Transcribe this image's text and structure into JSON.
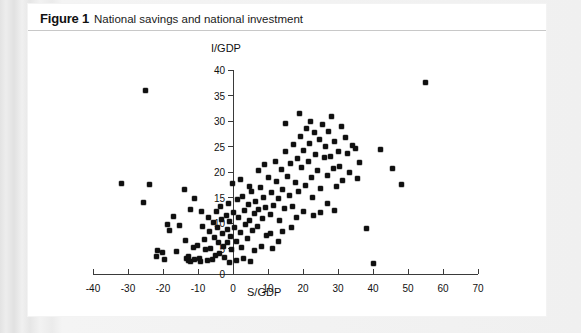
{
  "figure": {
    "label": "Figure 1",
    "title": "National savings and national investment"
  },
  "colors": {
    "page_background": "#e9e9e9",
    "figure_background": "#ffffff",
    "rule": "#c8c8c8",
    "axis": "#3a3a3a",
    "marker": "#101010",
    "text": "#111111"
  },
  "chart_data": {
    "type": "scatter",
    "title": "National savings and national investment",
    "xlabel": "S/GDP",
    "ylabel": "I/GDP",
    "xlim": [
      -45,
      72
    ],
    "ylim": [
      0,
      41
    ],
    "xticks": [
      -40,
      -30,
      -20,
      -10,
      0,
      10,
      20,
      30,
      40,
      50,
      60,
      70
    ],
    "xtick_labels": [
      "-40",
      "-30",
      "-20",
      "-10",
      "0",
      "10",
      "20",
      "30",
      "40",
      "50",
      "60",
      "70"
    ],
    "yticks": [
      0,
      5,
      10,
      15,
      20,
      25,
      30,
      35,
      40
    ],
    "ytick_labels": [
      "0",
      "5",
      "10",
      "15",
      "20",
      "25",
      "30",
      "35",
      "40"
    ],
    "grid": false,
    "legend": null,
    "axis_origin": [
      0,
      0
    ],
    "x_axis_position": "bottom",
    "y_axis_position": "zero",
    "series": [
      {
        "name": "Countries",
        "marker": "diamond",
        "color": "#101010",
        "points": [
          [
            -25.0,
            36.0
          ],
          [
            -32.0,
            17.8
          ],
          [
            -24.0,
            17.6
          ],
          [
            -25.5,
            14.0
          ],
          [
            -14.0,
            16.6
          ],
          [
            -17.0,
            11.3
          ],
          [
            -18.8,
            9.8
          ],
          [
            -18.2,
            8.6
          ],
          [
            -15.3,
            9.5
          ],
          [
            -12.2,
            12.6
          ],
          [
            -21.5,
            4.6
          ],
          [
            -20.2,
            4.3
          ],
          [
            -16.2,
            4.4
          ],
          [
            -13.6,
            6.6
          ],
          [
            -13.2,
            3.0
          ],
          [
            -12.8,
            2.6
          ],
          [
            -12.6,
            3.4
          ],
          [
            -12.2,
            2.4
          ],
          [
            -11.4,
            5.2
          ],
          [
            -10.9,
            2.9
          ],
          [
            -10.2,
            5.6
          ],
          [
            -9.6,
            3.1
          ],
          [
            -9.2,
            2.5
          ],
          [
            -8.7,
            9.4
          ],
          [
            -8.2,
            6.7
          ],
          [
            -7.8,
            4.9
          ],
          [
            -7.4,
            2.7
          ],
          [
            -7.0,
            11.0
          ],
          [
            -6.6,
            8.3
          ],
          [
            -6.4,
            5.0
          ],
          [
            -6.0,
            2.8
          ],
          [
            -5.7,
            10.1
          ],
          [
            -5.4,
            7.1
          ],
          [
            -5.0,
            3.6
          ],
          [
            -4.6,
            12.3
          ],
          [
            -4.4,
            9.1
          ],
          [
            -4.1,
            6.2
          ],
          [
            -3.8,
            4.1
          ],
          [
            -3.5,
            13.2
          ],
          [
            -3.2,
            10.6
          ],
          [
            -2.9,
            7.9
          ],
          [
            -2.6,
            5.4
          ],
          [
            -2.3,
            3.2
          ],
          [
            -2.0,
            11.4
          ],
          [
            -1.7,
            8.8
          ],
          [
            -1.5,
            6.1
          ],
          [
            -1.2,
            13.8
          ],
          [
            -0.9,
            10.2
          ],
          [
            -0.6,
            7.4
          ],
          [
            -0.3,
            4.8
          ],
          [
            0.2,
            12.0
          ],
          [
            0.5,
            9.2
          ],
          [
            0.9,
            6.3
          ],
          [
            1.2,
            14.6
          ],
          [
            1.6,
            11.1
          ],
          [
            2.0,
            8.2
          ],
          [
            2.4,
            5.1
          ],
          [
            2.8,
            15.2
          ],
          [
            3.2,
            12.4
          ],
          [
            3.6,
            9.8
          ],
          [
            4.0,
            7.0
          ],
          [
            4.4,
            13.6
          ],
          [
            4.8,
            10.5
          ],
          [
            5.2,
            16.2
          ],
          [
            5.6,
            8.6
          ],
          [
            6.0,
            11.8
          ],
          [
            6.5,
            14.2
          ],
          [
            7.0,
            9.4
          ],
          [
            7.4,
            12.6
          ],
          [
            7.9,
            17.0
          ],
          [
            8.3,
            10.8
          ],
          [
            8.8,
            15.0
          ],
          [
            9.2,
            13.0
          ],
          [
            9.7,
            7.6
          ],
          [
            10.1,
            19.0
          ],
          [
            10.6,
            11.6
          ],
          [
            11.0,
            16.0
          ],
          [
            11.5,
            13.4
          ],
          [
            12.0,
            22.0
          ],
          [
            12.4,
            18.2
          ],
          [
            12.9,
            14.8
          ],
          [
            13.3,
            10.4
          ],
          [
            13.8,
            20.4
          ],
          [
            14.2,
            16.6
          ],
          [
            14.7,
            12.8
          ],
          [
            15.1,
            24.0
          ],
          [
            15.6,
            19.2
          ],
          [
            16.0,
            15.4
          ],
          [
            16.5,
            21.6
          ],
          [
            17.0,
            13.2
          ],
          [
            17.4,
            25.4
          ],
          [
            17.9,
            18.0
          ],
          [
            18.3,
            22.6
          ],
          [
            18.8,
            16.2
          ],
          [
            19.2,
            27.0
          ],
          [
            19.7,
            20.8
          ],
          [
            20.1,
            24.2
          ],
          [
            20.6,
            17.4
          ],
          [
            21.0,
            28.6
          ],
          [
            21.5,
            22.0
          ],
          [
            21.9,
            25.6
          ],
          [
            22.4,
            19.0
          ],
          [
            22.8,
            15.0
          ],
          [
            23.3,
            27.8
          ],
          [
            23.7,
            23.4
          ],
          [
            24.2,
            20.2
          ],
          [
            24.6,
            26.4
          ],
          [
            25.1,
            16.8
          ],
          [
            25.5,
            29.4
          ],
          [
            26.0,
            22.8
          ],
          [
            26.4,
            25.0
          ],
          [
            26.9,
            19.4
          ],
          [
            27.3,
            28.0
          ],
          [
            27.8,
            23.0
          ],
          [
            28.2,
            30.8
          ],
          [
            28.7,
            20.6
          ],
          [
            29.1,
            26.0
          ],
          [
            29.6,
            17.2
          ],
          [
            30.0,
            24.0
          ],
          [
            30.5,
            21.0
          ],
          [
            31.0,
            29.0
          ],
          [
            31.4,
            18.4
          ],
          [
            32.0,
            26.8
          ],
          [
            32.6,
            23.6
          ],
          [
            33.2,
            20.0
          ],
          [
            34.0,
            25.2
          ],
          [
            35.0,
            24.6
          ],
          [
            35.6,
            18.8
          ],
          [
            36.2,
            21.8
          ],
          [
            38.0,
            9.0
          ],
          [
            40.0,
            2.0
          ],
          [
            42.0,
            24.4
          ],
          [
            45.5,
            20.6
          ],
          [
            48.0,
            17.6
          ],
          [
            55.0,
            37.5
          ],
          [
            -11.0,
            14.8
          ],
          [
            -9.0,
            12.2
          ],
          [
            10.8,
            8.0
          ],
          [
            14.0,
            8.4
          ],
          [
            18.0,
            11.0
          ],
          [
            20.0,
            12.2
          ],
          [
            23.0,
            11.4
          ],
          [
            25.0,
            12.0
          ],
          [
            27.0,
            13.8
          ],
          [
            29.0,
            12.4
          ],
          [
            16.8,
            9.2
          ],
          [
            13.0,
            6.4
          ],
          [
            6.2,
            4.6
          ],
          [
            8.0,
            5.4
          ],
          [
            11.2,
            5.0
          ],
          [
            -19.5,
            2.8
          ],
          [
            -22.0,
            3.4
          ],
          [
            -1.0,
            2.2
          ],
          [
            1.0,
            2.6
          ],
          [
            3.0,
            3.0
          ],
          [
            5.0,
            2.4
          ],
          [
            -0.2,
            17.8
          ],
          [
            2.2,
            18.6
          ],
          [
            4.6,
            17.2
          ],
          [
            7.2,
            20.2
          ],
          [
            9.0,
            21.4
          ],
          [
            15.0,
            29.6
          ],
          [
            19.0,
            31.4
          ],
          [
            22.0,
            30.0
          ]
        ]
      }
    ]
  }
}
